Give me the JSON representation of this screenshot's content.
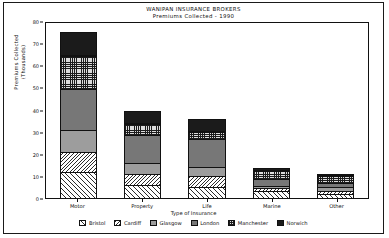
{
  "chart_data": {
    "type": "bar",
    "subtype": "stacked-bar",
    "title": "WANIPAN INSURANCE BROKERS",
    "subtitle": "Premiums Collected - 1990",
    "xlabel": "Type of Insurance",
    "ylabel_line1": "Premiums Collected",
    "ylabel_line2": "(Thousands)",
    "categories": [
      "Motor",
      "Property",
      "Life",
      "Marine",
      "Other"
    ],
    "ylim": [
      0,
      80
    ],
    "yticks": [
      0,
      10,
      20,
      30,
      40,
      50,
      60,
      70,
      80
    ],
    "grid": false,
    "legend_position": "bottom",
    "series": [
      {
        "name": "Bristol",
        "pattern": "diagonal-hatch",
        "values": [
          12,
          6,
          5,
          3,
          2
        ]
      },
      {
        "name": "Cardiff",
        "pattern": "backslash-hatch",
        "values": [
          9,
          5,
          5,
          1.5,
          1
        ]
      },
      {
        "name": "Glasgow",
        "pattern": "solid-gray",
        "values": [
          10,
          5,
          4,
          1,
          2
        ]
      },
      {
        "name": "London",
        "pattern": "solid-dark-gray",
        "values": [
          19,
          13,
          13,
          3,
          2
        ]
      },
      {
        "name": "Manchester",
        "pattern": "checkered",
        "values": [
          15,
          5,
          3,
          4,
          3
        ]
      },
      {
        "name": "Norwich",
        "pattern": "solid-black",
        "values": [
          11,
          6,
          6,
          1,
          0.5
        ]
      }
    ],
    "totals": [
      76,
      40,
      36,
      13.5,
      10.5
    ]
  }
}
